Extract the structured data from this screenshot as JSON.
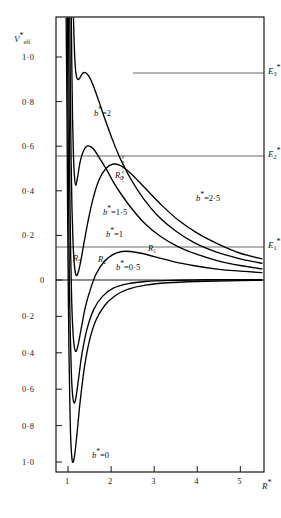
{
  "figure": {
    "background": "#ffffff",
    "curve_color": "#000000",
    "frame_color": "#000000",
    "level_color": "#444444"
  },
  "axes": {
    "y_axis_name": "V",
    "y_axis_sub": "eff",
    "y_axis_star": "*",
    "x_axis_name": "R",
    "x_axis_star": "*",
    "x_ticks": [
      "1",
      "2",
      "3",
      "4",
      "5"
    ],
    "x_tick_values": [
      1,
      2,
      3,
      4,
      5
    ],
    "y_ticks_upper": [
      "1·0",
      "0·8",
      "0·6",
      "0·4",
      "0·2",
      "0"
    ],
    "y_tick_values_upper": [
      1.0,
      0.8,
      0.6,
      0.4,
      0.2,
      0
    ],
    "y_ticks_lower": [
      "0·2",
      "0·4",
      "0·6",
      "0·8",
      "1·0"
    ],
    "y_tick_values_lower": [
      -0.2,
      -0.4,
      -0.6,
      -0.8,
      -1.0
    ],
    "xlim": [
      0.72,
      5.55
    ],
    "ylim": [
      -1.08,
      1.18
    ]
  },
  "curve_labels": [
    {
      "name": "b-2",
      "prefix": "b",
      "star": "*",
      "eq": "=",
      "value": "2",
      "x": 94,
      "y": 108
    },
    {
      "name": "b-2-5",
      "prefix": "b",
      "star": "*",
      "eq": "=",
      "value": "2·5",
      "x": 196,
      "y": 193
    },
    {
      "name": "b-1-5",
      "prefix": "b",
      "star": "*",
      "eq": "=",
      "value": "1·5",
      "x": 103,
      "y": 207
    },
    {
      "name": "b-1",
      "prefix": "b",
      "star": "*",
      "eq": "=",
      "value": "1",
      "x": 106,
      "y": 229
    },
    {
      "name": "b-0-5",
      "prefix": "b",
      "star": "*",
      "eq": "=",
      "value": "0·5",
      "x": 116,
      "y": 262
    },
    {
      "name": "b-0",
      "prefix": "b",
      "star": "*",
      "eq": "=",
      "value": "0",
      "x": 92,
      "y": 450
    }
  ],
  "point_labels": [
    {
      "name": "R0",
      "text": "R",
      "sub": "0",
      "x": 115,
      "y": 170
    },
    {
      "name": "R1",
      "text": "R",
      "sub": "1",
      "x": 148,
      "y": 243
    },
    {
      "name": "R2",
      "text": "R",
      "sub": "2",
      "x": 98,
      "y": 254
    },
    {
      "name": "R3",
      "text": "R",
      "sub": "3",
      "x": 73,
      "y": 253
    }
  ],
  "energy_levels": [
    {
      "name": "E3",
      "text": "E",
      "sub": "3",
      "star": "*",
      "value": 0.935,
      "y": 73,
      "x_start": 133
    },
    {
      "name": "E2",
      "text": "E",
      "sub": "2",
      "star": "*",
      "value": 0.6,
      "y": 156,
      "x_start": 56
    },
    {
      "name": "E1",
      "text": "E",
      "sub": "1",
      "star": "*",
      "value": 0.105,
      "y": 247,
      "x_start": 56
    }
  ],
  "chart_data": {
    "type": "line",
    "title": "",
    "xlabel": "R*",
    "ylabel": "V*eff",
    "xlim": [
      0.72,
      5.55
    ],
    "ylim": [
      -1.08,
      1.18
    ],
    "grid": false,
    "legend": "inline-curve-labels",
    "series": [
      {
        "name": "b*=0",
        "b_star": 0,
        "points": [
          [
            0.955,
            1.18
          ],
          [
            0.975,
            0.75
          ],
          [
            0.99,
            0.3
          ],
          [
            1.005,
            -0.05
          ],
          [
            1.02,
            -0.38
          ],
          [
            1.04,
            -0.66
          ],
          [
            1.06,
            -0.86
          ],
          [
            1.09,
            -0.98
          ],
          [
            1.12,
            -1.0
          ],
          [
            1.16,
            -0.95
          ],
          [
            1.21,
            -0.84
          ],
          [
            1.28,
            -0.67
          ],
          [
            1.38,
            -0.48
          ],
          [
            1.5,
            -0.33
          ],
          [
            1.65,
            -0.22
          ],
          [
            1.85,
            -0.14
          ],
          [
            2.1,
            -0.085
          ],
          [
            2.4,
            -0.05
          ],
          [
            2.8,
            -0.028
          ],
          [
            3.3,
            -0.015
          ],
          [
            4.0,
            -0.008
          ],
          [
            5.0,
            -0.003
          ],
          [
            5.5,
            -0.002
          ]
        ]
      },
      {
        "name": "b*=0.5",
        "b_star": 0.5,
        "points": [
          [
            0.985,
            1.18
          ],
          [
            1.0,
            0.72
          ],
          [
            1.015,
            0.32
          ],
          [
            1.03,
            0.0
          ],
          [
            1.05,
            -0.28
          ],
          [
            1.075,
            -0.5
          ],
          [
            1.105,
            -0.63
          ],
          [
            1.14,
            -0.675
          ],
          [
            1.18,
            -0.65
          ],
          [
            1.24,
            -0.55
          ],
          [
            1.32,
            -0.41
          ],
          [
            1.44,
            -0.27
          ],
          [
            1.6,
            -0.16
          ],
          [
            1.8,
            -0.09
          ],
          [
            2.05,
            -0.045
          ],
          [
            2.4,
            -0.02
          ],
          [
            2.8,
            -0.008
          ],
          [
            3.4,
            -0.002
          ],
          [
            4.2,
            0.001
          ],
          [
            5.0,
            0.002
          ],
          [
            5.5,
            0.002
          ]
        ]
      },
      {
        "name": "b*=1",
        "b_star": 1,
        "points": [
          [
            1.01,
            1.18
          ],
          [
            1.025,
            0.78
          ],
          [
            1.04,
            0.42
          ],
          [
            1.06,
            0.12
          ],
          [
            1.085,
            -0.12
          ],
          [
            1.115,
            -0.29
          ],
          [
            1.15,
            -0.375
          ],
          [
            1.19,
            -0.39
          ],
          [
            1.24,
            -0.35
          ],
          [
            1.31,
            -0.26
          ],
          [
            1.4,
            -0.15
          ],
          [
            1.52,
            -0.05
          ],
          [
            1.66,
            0.03
          ],
          [
            1.85,
            0.085
          ],
          [
            2.05,
            0.115
          ],
          [
            2.25,
            0.128
          ],
          [
            2.45,
            0.128
          ],
          [
            2.7,
            0.12
          ],
          [
            3.0,
            0.105
          ],
          [
            3.4,
            0.085
          ],
          [
            3.9,
            0.065
          ],
          [
            4.5,
            0.048
          ],
          [
            5.0,
            0.04
          ],
          [
            5.5,
            0.033
          ]
        ]
      },
      {
        "name": "b*=1.5",
        "b_star": 1.5,
        "points": [
          [
            1.04,
            1.18
          ],
          [
            1.055,
            0.82
          ],
          [
            1.07,
            0.55
          ],
          [
            1.09,
            0.33
          ],
          [
            1.115,
            0.17
          ],
          [
            1.145,
            0.07
          ],
          [
            1.18,
            0.025
          ],
          [
            1.22,
            0.025
          ],
          [
            1.28,
            0.07
          ],
          [
            1.36,
            0.155
          ],
          [
            1.46,
            0.26
          ],
          [
            1.58,
            0.365
          ],
          [
            1.72,
            0.45
          ],
          [
            1.88,
            0.5
          ],
          [
            2.05,
            0.52
          ],
          [
            2.25,
            0.51
          ],
          [
            2.5,
            0.47
          ],
          [
            2.8,
            0.41
          ],
          [
            3.15,
            0.34
          ],
          [
            3.55,
            0.27
          ],
          [
            4.0,
            0.21
          ],
          [
            4.5,
            0.16
          ],
          [
            5.0,
            0.12
          ],
          [
            5.5,
            0.095
          ]
        ]
      },
      {
        "name": "b*=2",
        "b_star": 2,
        "points": [
          [
            1.075,
            1.18
          ],
          [
            1.09,
            0.92
          ],
          [
            1.105,
            0.72
          ],
          [
            1.125,
            0.56
          ],
          [
            1.15,
            0.46
          ],
          [
            1.18,
            0.425
          ],
          [
            1.22,
            0.46
          ],
          [
            1.28,
            0.53
          ],
          [
            1.35,
            0.575
          ],
          [
            1.42,
            0.598
          ],
          [
            1.5,
            0.6
          ],
          [
            1.6,
            0.585
          ],
          [
            1.72,
            0.55
          ],
          [
            1.88,
            0.5
          ],
          [
            2.05,
            0.44
          ],
          [
            2.25,
            0.38
          ],
          [
            2.5,
            0.315
          ],
          [
            2.8,
            0.25
          ],
          [
            3.15,
            0.195
          ],
          [
            3.55,
            0.15
          ],
          [
            4.0,
            0.115
          ],
          [
            4.5,
            0.085
          ],
          [
            5.0,
            0.065
          ],
          [
            5.5,
            0.05
          ]
        ]
      },
      {
        "name": "b*=2.5-upper",
        "b_star": 2.5,
        "points": [
          [
            1.125,
            1.18
          ],
          [
            1.15,
            1.02
          ],
          [
            1.18,
            0.93
          ],
          [
            1.22,
            0.9
          ],
          [
            1.27,
            0.905
          ],
          [
            1.33,
            0.925
          ],
          [
            1.4,
            0.93
          ],
          [
            1.48,
            0.915
          ],
          [
            1.58,
            0.875
          ],
          [
            1.7,
            0.81
          ],
          [
            1.85,
            0.725
          ],
          [
            2.02,
            0.635
          ],
          [
            2.2,
            0.55
          ],
          [
            2.45,
            0.455
          ],
          [
            2.75,
            0.365
          ],
          [
            3.1,
            0.285
          ],
          [
            3.5,
            0.22
          ],
          [
            3.95,
            0.165
          ],
          [
            4.45,
            0.125
          ],
          [
            5.0,
            0.095
          ],
          [
            5.5,
            0.075
          ]
        ]
      }
    ]
  }
}
